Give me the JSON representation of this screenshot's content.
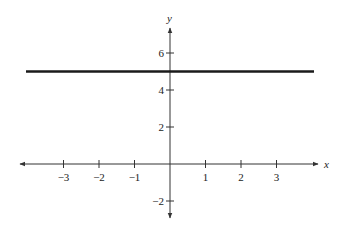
{
  "chart_data": {
    "type": "line",
    "title": "",
    "xlabel": "x",
    "ylabel": "y",
    "xlim": [
      -4.1,
      4.1
    ],
    "ylim": [
      -2.6,
      7.5
    ],
    "grid": false,
    "legend": null,
    "x_ticks": [
      -3,
      -2,
      -1,
      1,
      2,
      3
    ],
    "x_tick_labels": [
      "−3",
      "−2",
      "−1",
      "1",
      "2",
      "3"
    ],
    "y_ticks": [
      6,
      4,
      2,
      -2
    ],
    "y_tick_labels": [
      "6",
      "4",
      "2",
      "−2"
    ],
    "series": [
      {
        "name": "y = 5",
        "x": [
          -4,
          4
        ],
        "y": [
          5,
          5
        ],
        "color": "#1a1a1a",
        "line_width": 2.5
      }
    ],
    "axes": {
      "x_arrows": "both",
      "y_arrows": "both",
      "color": "#333333"
    }
  },
  "layout": {
    "origin_px": [
      170,
      164
    ],
    "x_unit_px": 35.5,
    "y_unit_px": 18.5,
    "x_axis_px": [
      20,
      318
    ],
    "y_axis_px": [
      28,
      218
    ],
    "line_x_px": [
      26,
      314
    ]
  }
}
